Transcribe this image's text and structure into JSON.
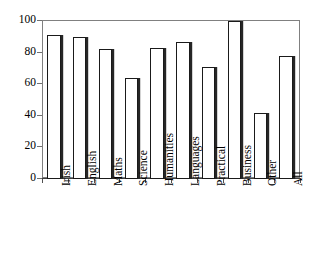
{
  "chart_data": {
    "type": "bar",
    "title": "",
    "subtitle": "",
    "xlabel": "",
    "ylabel": "",
    "categories": [
      "Irish",
      "English",
      "Maths",
      "Science",
      "Humanities",
      "Languages",
      "Practical",
      "Business",
      "Other",
      "All"
    ],
    "values": [
      91,
      90,
      82,
      64,
      83,
      87,
      71,
      100,
      42,
      78
    ],
    "ylim": [
      0,
      100
    ],
    "yticks": [
      0,
      20,
      40,
      60,
      80,
      100
    ],
    "ytick_labels": [
      "0",
      "20",
      "40",
      "60",
      "80",
      "100"
    ],
    "grid": false,
    "legend": null,
    "legend_position": "none",
    "bar_fill_color": "#ffffff",
    "bar_edge_color": "#1a1a1a",
    "bar_shadow_color": "#262626",
    "axis_color": "#808080",
    "annotations": []
  },
  "axes": {
    "y": {
      "ticks": [
        {
          "value": 100,
          "label": "100"
        },
        {
          "value": 80,
          "label": "80"
        },
        {
          "value": 60,
          "label": "60"
        },
        {
          "value": 40,
          "label": "40"
        },
        {
          "value": 20,
          "label": "20"
        },
        {
          "value": 0,
          "label": "0"
        }
      ]
    },
    "x": {
      "ticks": [
        {
          "label": "Irish"
        },
        {
          "label": "English"
        },
        {
          "label": "Maths"
        },
        {
          "label": "Science"
        },
        {
          "label": "Humanities"
        },
        {
          "label": "Languages"
        },
        {
          "label": "Practical"
        },
        {
          "label": "Business"
        },
        {
          "label": "Other"
        },
        {
          "label": "All"
        }
      ]
    }
  }
}
